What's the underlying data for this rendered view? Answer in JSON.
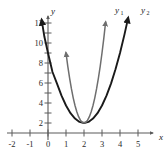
{
  "chart_data": {
    "type": "line",
    "title": "",
    "xlabel": "x",
    "ylabel": "y",
    "xlim": [
      -2.35,
      5.6
    ],
    "ylim": [
      -0.55,
      12.6
    ],
    "grid": false,
    "legend_position": "curve-end-labels",
    "x_ticks": [
      -2,
      -1,
      0,
      1,
      2,
      3,
      4,
      5
    ],
    "x_tick_labels": [
      "-2",
      "-1",
      "0",
      "1",
      "2",
      "3",
      "4",
      "5"
    ],
    "y_ticks": [
      2,
      4,
      6,
      8,
      10,
      12
    ],
    "y_tick_labels": [
      "2",
      "4",
      "6",
      "8",
      "10",
      "12"
    ],
    "series": [
      {
        "name": "y1",
        "label": "y",
        "subscript": "1",
        "color": "#6e6e6e",
        "vertex": [
          2,
          1
        ],
        "leading_coefficient": 7,
        "points": [
          [
            1.0,
            8.0
          ],
          [
            1.1,
            6.67
          ],
          [
            1.2,
            5.48
          ],
          [
            1.3,
            4.43
          ],
          [
            1.4,
            3.52
          ],
          [
            1.5,
            2.75
          ],
          [
            1.6,
            2.12
          ],
          [
            1.7,
            1.63
          ],
          [
            1.8,
            1.28
          ],
          [
            1.9,
            1.07
          ],
          [
            2.0,
            1.0
          ],
          [
            2.1,
            1.07
          ],
          [
            2.2,
            1.28
          ],
          [
            2.3,
            1.63
          ],
          [
            2.4,
            2.12
          ],
          [
            2.5,
            2.75
          ],
          [
            2.6,
            3.52
          ],
          [
            2.7,
            4.43
          ],
          [
            2.8,
            5.48
          ],
          [
            2.9,
            6.67
          ],
          [
            3.0,
            8.0
          ],
          [
            3.1,
            9.47
          ],
          [
            3.2,
            11.08
          ]
        ]
      },
      {
        "name": "y2",
        "label": "y",
        "subscript": "2",
        "color": "#1a1a1a",
        "vertex": [
          2,
          1
        ],
        "leading_coefficient": 1.75,
        "points": [
          [
            -0.35,
            11.28
          ],
          [
            -0.2,
            9.62
          ],
          [
            0.0,
            8.0
          ],
          [
            0.25,
            6.1
          ],
          [
            0.5,
            4.94
          ],
          [
            0.75,
            3.73
          ],
          [
            1.0,
            2.75
          ],
          [
            1.25,
            1.98
          ],
          [
            1.5,
            1.44
          ],
          [
            1.75,
            1.11
          ],
          [
            2.0,
            1.0
          ],
          [
            2.25,
            1.11
          ],
          [
            2.5,
            1.44
          ],
          [
            2.75,
            1.98
          ],
          [
            3.0,
            2.75
          ],
          [
            3.25,
            3.73
          ],
          [
            3.5,
            4.94
          ],
          [
            3.75,
            6.37
          ],
          [
            4.0,
            8.0
          ],
          [
            4.25,
            9.86
          ],
          [
            4.45,
            11.49
          ]
        ]
      }
    ]
  },
  "axes": {
    "x_axis_name": "x",
    "y_axis_name": "y"
  },
  "labels": {
    "y1_text": "y",
    "y1_sub": "1",
    "y2_text": "y",
    "y2_sub": "2"
  },
  "colors": {
    "curve_y1": "#6e6e6e",
    "curve_y2": "#1a1a1a",
    "axis": "#5a5a5a",
    "text": "#1a1a1a",
    "background": "#ffffff"
  }
}
